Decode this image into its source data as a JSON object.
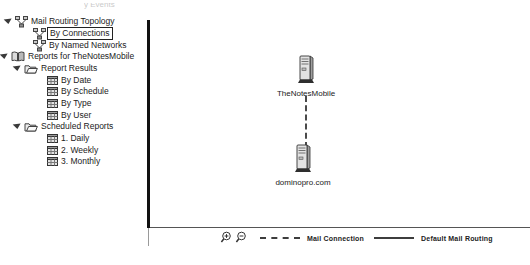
{
  "colors": {
    "background": "#ffffff",
    "divider": "#111111",
    "tree_text": "#222222",
    "selection_border": "#222222",
    "connector_line": "#4a4a4a"
  },
  "tree": {
    "clipped_top_text": "y Events",
    "items": [
      {
        "label": "Mail Routing Topology",
        "icon": "topology-icon",
        "expanded": true
      },
      {
        "label": "By Connections",
        "icon": "topology-icon",
        "selected": true
      },
      {
        "label": "By Named Networks",
        "icon": "topology-icon"
      },
      {
        "label": "Reports for TheNotesMobile",
        "icon": "book-icon",
        "expanded": true
      },
      {
        "label": "Report Results",
        "icon": "folder-icon",
        "expanded": true
      },
      {
        "label": "By Date",
        "icon": "report-icon"
      },
      {
        "label": "By Schedule",
        "icon": "report-icon"
      },
      {
        "label": "By Type",
        "icon": "report-icon"
      },
      {
        "label": "By User",
        "icon": "report-icon"
      },
      {
        "label": "Scheduled Reports",
        "icon": "folder-icon",
        "expanded": true
      },
      {
        "label": "1. Daily",
        "icon": "report-icon"
      },
      {
        "label": "2. Weekly",
        "icon": "report-icon"
      },
      {
        "label": "3. Monthly",
        "icon": "report-icon"
      }
    ]
  },
  "map": {
    "nodes": [
      {
        "label": "TheNotesMobile",
        "icon": "server-icon"
      },
      {
        "label": "dominopro.com",
        "icon": "server-icon"
      }
    ],
    "connection": {
      "style": "dashed",
      "type": "mail-connection"
    }
  },
  "legend": {
    "zoom_in_icon": "zoom-in-magnifier",
    "zoom_out_icon": "zoom-out-magnifier",
    "items": [
      {
        "label": "Mail Connection",
        "line_style": "dashed"
      },
      {
        "label": "Default Mail Routing",
        "line_style": "solid"
      }
    ]
  }
}
